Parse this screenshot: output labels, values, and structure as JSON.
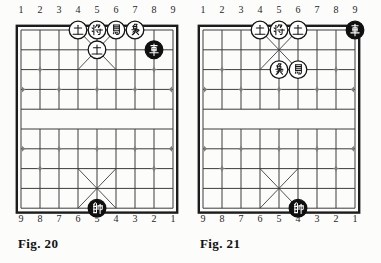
{
  "figure": {
    "type": "xiangqi-endgame-diagrams",
    "boards": [
      {
        "id": "fig-20",
        "caption": "Fig. 20",
        "top_file_numbers": [
          "1",
          "2",
          "3",
          "4",
          "5",
          "6",
          "7",
          "8",
          "9"
        ],
        "bottom_file_numbers": [
          "9",
          "8",
          "7",
          "6",
          "5",
          "4",
          "3",
          "2",
          "1"
        ],
        "pieces": [
          {
            "label": "士",
            "name": "advisor",
            "side": "outline",
            "file": 4,
            "rank": 1
          },
          {
            "label": "将",
            "name": "general",
            "side": "outline",
            "file": 5,
            "rank": 1
          },
          {
            "label": "馬",
            "name": "horse",
            "side": "outline",
            "file": 6,
            "rank": 1
          },
          {
            "label": "象",
            "name": "elephant",
            "side": "outline",
            "file": 7,
            "rank": 1
          },
          {
            "label": "士",
            "name": "advisor",
            "side": "outline",
            "file": 5,
            "rank": 2
          },
          {
            "label": "車",
            "name": "chariot",
            "side": "solid",
            "file": 8,
            "rank": 2
          },
          {
            "label": "帥",
            "name": "general",
            "side": "solid",
            "file": 5,
            "rank": 10
          }
        ]
      },
      {
        "id": "fig-21",
        "caption": "Fig. 21",
        "top_file_numbers": [
          "1",
          "2",
          "3",
          "4",
          "5",
          "6",
          "7",
          "8",
          "9"
        ],
        "bottom_file_numbers": [
          "9",
          "8",
          "7",
          "6",
          "5",
          "4",
          "3",
          "2",
          "1"
        ],
        "pieces": [
          {
            "label": "士",
            "name": "advisor",
            "side": "outline",
            "file": 4,
            "rank": 1
          },
          {
            "label": "将",
            "name": "general",
            "side": "outline",
            "file": 5,
            "rank": 1
          },
          {
            "label": "士",
            "name": "advisor",
            "side": "outline",
            "file": 6,
            "rank": 1
          },
          {
            "label": "車",
            "name": "chariot",
            "side": "solid",
            "file": 9,
            "rank": 1
          },
          {
            "label": "象",
            "name": "elephant",
            "side": "outline",
            "file": 5,
            "rank": 3
          },
          {
            "label": "馬",
            "name": "horse",
            "side": "outline",
            "file": 6,
            "rank": 3
          },
          {
            "label": "帥",
            "name": "general",
            "side": "solid",
            "file": 6,
            "rank": 10
          }
        ]
      }
    ],
    "colors": {
      "background": "#fcfcfb",
      "grid_line": "#3c3c3c",
      "border": "#1c1c1c",
      "marker": "#7d7d7d",
      "piece_outline_fill": "#ffffff",
      "piece_outline_stroke": "#141414",
      "piece_solid_fill": "#101010",
      "piece_solid_text": "#ffffff",
      "number_text": "#262626",
      "caption_text": "#111111"
    }
  }
}
